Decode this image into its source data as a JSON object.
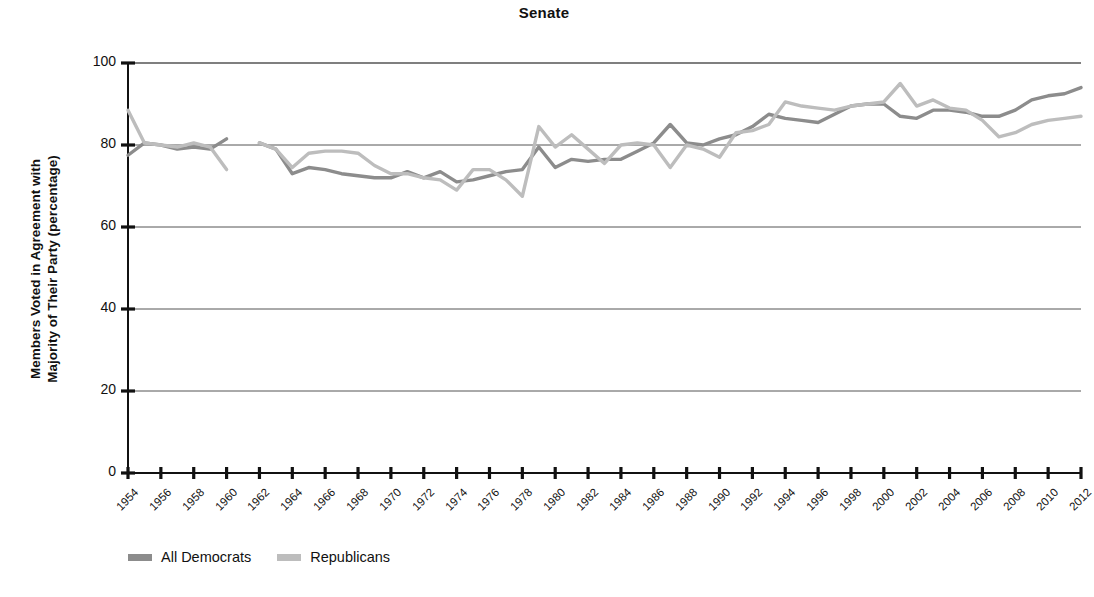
{
  "chart_data": {
    "type": "line",
    "title": "Senate",
    "xlabel": "",
    "ylabel": "Members Voted in Agreement with Majority of Their Party (percentage)",
    "ylabel_line1": "Members Voted in Agreement with",
    "ylabel_line2": "Majority of Their Party (percentage)",
    "ylim": [
      0,
      100
    ],
    "yticks": [
      0,
      20,
      40,
      60,
      80,
      100
    ],
    "ytick_labels": [
      "0",
      "20",
      "40",
      "60",
      "80",
      "100"
    ],
    "xlim": [
      1954,
      2012
    ],
    "xticks": [
      1954,
      1956,
      1958,
      1960,
      1962,
      1964,
      1966,
      1968,
      1970,
      1972,
      1974,
      1976,
      1978,
      1980,
      1982,
      1984,
      1986,
      1988,
      1990,
      1992,
      1994,
      1996,
      1998,
      2000,
      2002,
      2004,
      2006,
      2008,
      2010,
      2012
    ],
    "xtick_labels": [
      "1954",
      "1956",
      "1958",
      "1960",
      "1962",
      "1964",
      "1966",
      "1968",
      "1970",
      "1972",
      "1974",
      "1976",
      "1978",
      "1980",
      "1982",
      "1984",
      "1986",
      "1988",
      "1990",
      "1992",
      "1994",
      "1996",
      "1998",
      "2000",
      "2002",
      "2004",
      "2006",
      "2008",
      "2010",
      "2012"
    ],
    "grid": true,
    "gridlines_y": [
      20,
      40,
      60,
      80,
      100
    ],
    "legend_position": "below-left",
    "x": [
      1954,
      1955,
      1956,
      1957,
      1958,
      1959,
      1960,
      1961,
      1962,
      1963,
      1964,
      1965,
      1966,
      1967,
      1968,
      1969,
      1970,
      1971,
      1972,
      1973,
      1974,
      1975,
      1976,
      1977,
      1978,
      1979,
      1980,
      1981,
      1982,
      1983,
      1984,
      1985,
      1986,
      1987,
      1988,
      1989,
      1990,
      1991,
      1992,
      1993,
      1994,
      1995,
      1996,
      1997,
      1998,
      1999,
      2000,
      2001,
      2002,
      2003,
      2004,
      2005,
      2006,
      2007,
      2008,
      2009,
      2010,
      2011,
      2012
    ],
    "series": [
      {
        "name": "All Democrats",
        "color": "#8c8c8c",
        "values": [
          77.5,
          80.5,
          80.0,
          79.0,
          79.5,
          79.0,
          81.5,
          null,
          80.5,
          79.0,
          73.0,
          74.5,
          74.0,
          73.0,
          72.5,
          72.0,
          72.0,
          73.5,
          72.0,
          73.5,
          71.0,
          71.5,
          72.5,
          73.5,
          74.0,
          79.5,
          74.5,
          76.5,
          76.0,
          76.5,
          76.5,
          78.5,
          80.5,
          85.0,
          80.5,
          80.0,
          81.5,
          82.5,
          84.5,
          87.5,
          86.5,
          86.0,
          85.5,
          87.5,
          89.5,
          90.0,
          90.0,
          87.0,
          86.5,
          88.5,
          88.5,
          88.0,
          87.0,
          87.0,
          88.5,
          91.0,
          92.0,
          92.5,
          94.0
        ]
      },
      {
        "name": "Republicans",
        "color": "#bdbdbd",
        "values": [
          88.5,
          80.5,
          80.0,
          79.5,
          80.5,
          79.5,
          74.0,
          null,
          80.5,
          79.0,
          74.5,
          78.0,
          78.5,
          78.5,
          78.0,
          75.0,
          73.0,
          73.0,
          72.0,
          71.5,
          69.0,
          74.0,
          74.0,
          71.5,
          67.5,
          84.5,
          79.5,
          82.5,
          79.0,
          75.5,
          80.0,
          80.5,
          80.0,
          74.5,
          80.0,
          79.0,
          77.0,
          83.0,
          83.5,
          85.0,
          90.5,
          89.5,
          89.0,
          88.5,
          89.5,
          90.0,
          90.5,
          95.0,
          89.5,
          91.0,
          89.0,
          88.5,
          86.0,
          82.0,
          83.0,
          85.0,
          86.0,
          86.5,
          87.0
        ]
      }
    ]
  },
  "legend": {
    "items": [
      {
        "label": "All Democrats",
        "color": "#8c8c8c"
      },
      {
        "label": "Republicans",
        "color": "#bdbdbd"
      }
    ]
  },
  "axis": {
    "axis_color": "#111111",
    "grid_color": "#555555"
  }
}
